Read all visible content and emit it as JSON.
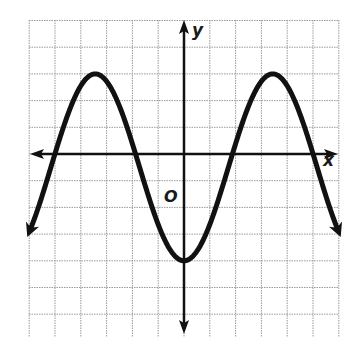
{
  "chart_data": {
    "type": "line",
    "title": "",
    "xlabel": "x",
    "ylabel": "y",
    "origin_label": "O",
    "grid": true,
    "grid_units": {
      "x_min": -6,
      "x_max": 6,
      "y_min": -6,
      "y_max": 6
    },
    "xlim": [
      -6,
      6
    ],
    "ylim": [
      -6,
      6
    ],
    "function": "y = -3.5*cos(2*pi*x/6.88) - 0.5",
    "features": {
      "maximum_value": 3,
      "minimum_value": -4,
      "minimum_point": [
        0,
        -4
      ],
      "maximum_points": [
        [
          -3.44,
          3
        ],
        [
          3.44,
          3
        ]
      ],
      "midline": -0.5,
      "amplitude": 3.5,
      "period": 6.88,
      "x_intercepts": [
        -5.0,
        -1.9,
        1.9,
        5.0
      ],
      "ends_with_arrows": true
    },
    "series": [
      {
        "name": "curve",
        "x": [
          -6,
          -5,
          -4,
          -3.44,
          -3,
          -2,
          -1,
          0,
          1,
          2,
          3,
          3.44,
          4,
          5,
          6
        ],
        "y": [
          -2.93,
          0.0,
          2.7,
          3.0,
          2.86,
          0.71,
          -2.57,
          -4.0,
          -2.57,
          0.71,
          2.86,
          3.0,
          2.7,
          0.0,
          -2.93
        ]
      }
    ]
  },
  "colors": {
    "curve": "#111111",
    "axes": "#111111",
    "grid": "#9a9a9a",
    "background": "#ffffff"
  }
}
